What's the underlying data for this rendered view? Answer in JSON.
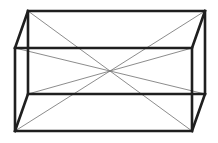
{
  "figure": {
    "kind": "line-drawing",
    "projection": "oblique-parallel",
    "canvas": {
      "width": 218,
      "height": 143,
      "background": "#ffffff"
    },
    "style": {
      "edge_color": "#1f1f1f",
      "edge_width": 2.6,
      "diagonal_color": "#6e6e6e",
      "diagonal_width": 0.8
    },
    "vertices": {
      "front_top_left": {
        "x": 15,
        "y": 48
      },
      "front_top_right": {
        "x": 192,
        "y": 48
      },
      "front_bottom_right": {
        "x": 192,
        "y": 131
      },
      "front_bottom_left": {
        "x": 15,
        "y": 131
      },
      "back_top_left": {
        "x": 28,
        "y": 11
      },
      "back_top_right": {
        "x": 205,
        "y": 11
      },
      "back_bottom_right": {
        "x": 205,
        "y": 94
      },
      "back_bottom_left": {
        "x": 28,
        "y": 94
      },
      "center": {
        "x": 110,
        "y": 71
      }
    },
    "edges": [
      {
        "name": "front-top-edge",
        "from": "front_top_left",
        "to": "front_top_right"
      },
      {
        "name": "front-right-edge",
        "from": "front_top_right",
        "to": "front_bottom_right"
      },
      {
        "name": "front-bottom-edge",
        "from": "front_bottom_right",
        "to": "front_bottom_left"
      },
      {
        "name": "front-left-edge",
        "from": "front_bottom_left",
        "to": "front_top_left"
      },
      {
        "name": "back-top-edge",
        "from": "back_top_left",
        "to": "back_top_right"
      },
      {
        "name": "back-right-edge",
        "from": "back_top_right",
        "to": "back_bottom_right"
      },
      {
        "name": "back-bottom-edge",
        "from": "back_bottom_right",
        "to": "back_bottom_left"
      },
      {
        "name": "back-left-edge",
        "from": "back_bottom_left",
        "to": "back_top_left"
      },
      {
        "name": "connector-top-left",
        "from": "front_top_left",
        "to": "back_top_left"
      },
      {
        "name": "connector-top-right",
        "from": "front_top_right",
        "to": "back_top_right"
      },
      {
        "name": "connector-bottom-right",
        "from": "front_bottom_right",
        "to": "back_bottom_right"
      },
      {
        "name": "connector-bottom-left",
        "from": "front_bottom_left",
        "to": "back_bottom_left"
      }
    ],
    "diagonals": [
      {
        "name": "space-diagonal-1",
        "from": "back_top_left",
        "to": "front_bottom_right"
      },
      {
        "name": "space-diagonal-2",
        "from": "back_top_right",
        "to": "front_bottom_left"
      },
      {
        "name": "space-diagonal-3",
        "from": "back_bottom_left",
        "to": "front_top_right"
      },
      {
        "name": "space-diagonal-4",
        "from": "back_bottom_right",
        "to": "front_top_left"
      }
    ],
    "paths": {
      "front_face": "M 15 48 L 192 48 L 192 131 L 15 131 Z",
      "back_face": "M 28 11 L 205 11 L 205 94 L 28 94 Z",
      "connector_tl": "M 15 48 L 28 11",
      "connector_tr": "M 192 48 L 205 11",
      "connector_br": "M 192 131 L 205 94",
      "connector_bl": "M 15 131 L 28 94",
      "space_diagonal_1": "M 28 11 L 192 131",
      "space_diagonal_2": "M 205 11 L 15 131",
      "space_diagonal_3": "M 28 94 L 192 48",
      "space_diagonal_4": "M 205 94 L 15 48"
    }
  }
}
